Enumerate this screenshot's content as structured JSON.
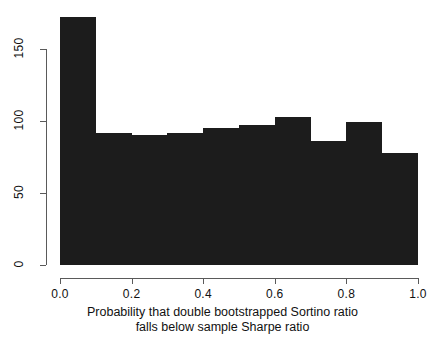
{
  "chart_data": {
    "type": "bar",
    "title": "",
    "subtitle": "",
    "xlabel": "Probability that double bootstrapped Sortino ratio falls below sample Sharpe ratio",
    "xlabel_lines": [
      "Probability that double bootstrapped Sortino ratio",
      "falls below sample Sharpe ratio"
    ],
    "ylabel": "",
    "grid": false,
    "legend": null,
    "bar_color": "#1c1c1c",
    "axis_color": "#5a5a5a",
    "background": "#ffffff",
    "xlim": [
      0.0,
      1.0
    ],
    "ylim": [
      0,
      172
    ],
    "bin_width": 0.1,
    "bin_edges": [
      0.0,
      0.1,
      0.2,
      0.3,
      0.4,
      0.5,
      0.6,
      0.7,
      0.8,
      0.9,
      1.0
    ],
    "categories": [
      "0.0-0.1",
      "0.1-0.2",
      "0.2-0.3",
      "0.3-0.4",
      "0.4-0.5",
      "0.5-0.6",
      "0.6-0.7",
      "0.7-0.8",
      "0.8-0.9",
      "0.9-1.0"
    ],
    "values": [
      172,
      92,
      90,
      92,
      95,
      97,
      103,
      86,
      99,
      78
    ],
    "x_ticks": [
      {
        "value": 0.0,
        "label": "0.0"
      },
      {
        "value": 0.2,
        "label": "0.2"
      },
      {
        "value": 0.4,
        "label": "0.4"
      },
      {
        "value": 0.6,
        "label": "0.6"
      },
      {
        "value": 0.8,
        "label": "0.8"
      },
      {
        "value": 1.0,
        "label": "1.0"
      }
    ],
    "y_ticks": [
      {
        "value": 0,
        "label": "0"
      },
      {
        "value": 50,
        "label": "50"
      },
      {
        "value": 100,
        "label": "100"
      },
      {
        "value": 150,
        "label": "150"
      }
    ]
  }
}
